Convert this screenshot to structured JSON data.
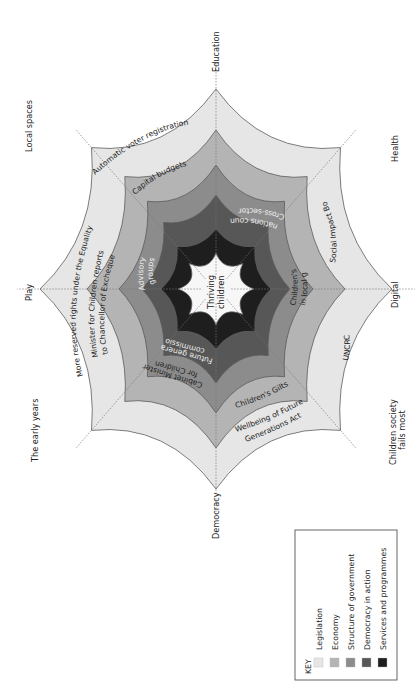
{
  "diagram": {
    "center": {
      "x": 216,
      "y": 289
    },
    "axes": [
      {
        "label": "Education",
        "angle": -90
      },
      {
        "label": "Health",
        "angle": -45
      },
      {
        "label": "Digital",
        "angle": 0
      },
      {
        "label": "Children society fails most",
        "label_lines": [
          "Children society",
          "fails most"
        ],
        "angle": 45
      },
      {
        "label": "Democracy",
        "angle": 90
      },
      {
        "label": "The early years",
        "angle": 135
      },
      {
        "label": "Play",
        "angle": 180
      },
      {
        "label": "Local spaces",
        "angle": -135
      }
    ],
    "rings": [
      {
        "name": "Legislation",
        "color": "#e6e6e6",
        "rx": 176,
        "ry": 200
      },
      {
        "name": "Economy",
        "color": "#b4b4b4",
        "rx": 129,
        "ry": 159
      },
      {
        "name": "Structure of government",
        "color": "#8c8c8c",
        "rx": 97,
        "ry": 124
      },
      {
        "name": "Democracy in action",
        "color": "#575757",
        "rx": 74,
        "ry": 94
      },
      {
        "name": "Services and programmes",
        "color": "#1e1e1e",
        "rx": 55,
        "ry": 60
      },
      {
        "name": "Thriving children",
        "color": "#f7f7f7",
        "rx": 38,
        "ry": 36
      }
    ],
    "ring_items": {
      "legislation": [
        "Automatic voter registration",
        "More reserved rights under the Equality Act",
        "Wellbeing of Future Generations Act",
        "UNCRC"
      ],
      "economy": [
        "Capital budgets",
        "Social Impact Bonds",
        "Children's Gilts",
        "Minister for Chancellor of Exchequer"
      ],
      "structure_of_government": [
        "Children reports to Chancellor of Exchequer",
        "Children's Champions in local government",
        "Cabinet Minister for Children"
      ],
      "democracy_in_action": [
        "Cross-sector nations council",
        "Advisory groups",
        "Future generations commissioner"
      ]
    },
    "labels": {
      "automatic_voter": "Automatic voter registration",
      "capital_budgets": "Capital budgets",
      "cross_sector_1": "Cross-sector",
      "cross_sector_2": "nations council",
      "social_impact": "Social Impact Bonds",
      "champions_1": "Children's Champions",
      "champions_2": "in local government",
      "uncrc": "UNCRC",
      "childrens_gilts": "Children's Gilts",
      "wellbeing_1": "Wellbeing of Future",
      "wellbeing_2": "Generations Act",
      "cabinet_1": "Cabinet Minister",
      "cabinet_2": "for Children",
      "future_gen_1": "Future generations",
      "future_gen_2": "commissioner",
      "reserved_rights": "More reserved rights under the Equality Act",
      "minister_1": "Minister for Children reports",
      "minister_2": "to Chancellor of Exchequer",
      "advisory_1": "Advisory",
      "advisory_2": "groups",
      "thriving_1": "Thriving",
      "thriving_2": "children"
    }
  },
  "key": {
    "title": "KEY",
    "items": [
      {
        "label": "Legislation",
        "color": "#e6e6e6"
      },
      {
        "label": "Economy",
        "color": "#b4b4b4"
      },
      {
        "label": "Structure of government",
        "color": "#8c8c8c"
      },
      {
        "label": "Democracy in action",
        "color": "#575757"
      },
      {
        "label": "Services and programmes",
        "color": "#1e1e1e"
      }
    ]
  }
}
